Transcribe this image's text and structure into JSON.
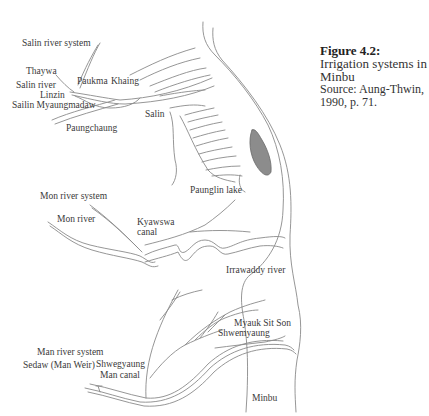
{
  "caption": {
    "figure": "Figure 4.2:",
    "title": "Irrigation systems in Minbu",
    "source": "Source: Aung-Thwin, 1990, p. 71."
  },
  "labels": {
    "salin_system": "Salin river system",
    "thaywa": "Thaywa",
    "salin_river": "Salin river",
    "linzin": "Linzin",
    "sailin_myaungmadaw": "Sailin Myaungmadaw",
    "paukma": "Paukma",
    "khaing": "Khaing",
    "paungchaung": "Paungchaung",
    "salin": "Salin",
    "paunglin_lake": "Paunglin lake",
    "mon_system": "Mon river system",
    "mon_river": "Mon river",
    "kyawswa_canal_1": "Kyawswa",
    "kyawswa_canal_2": "canal",
    "irrawaddy": "Irrawaddy river",
    "myauk_sit_son": "Myauk Sit Son",
    "shwemyaung": "Shwemyaung",
    "man_system": "Man river system",
    "sedaw": "Sedaw (Man Weir)",
    "shwegyaung": "Shwegyaung",
    "man_canal": "Man canal",
    "minbu": "Minbu"
  },
  "colors": {
    "line": "#8a8a8a",
    "lake_fill": "#8c8c8c",
    "text": "#3a3a3a"
  }
}
